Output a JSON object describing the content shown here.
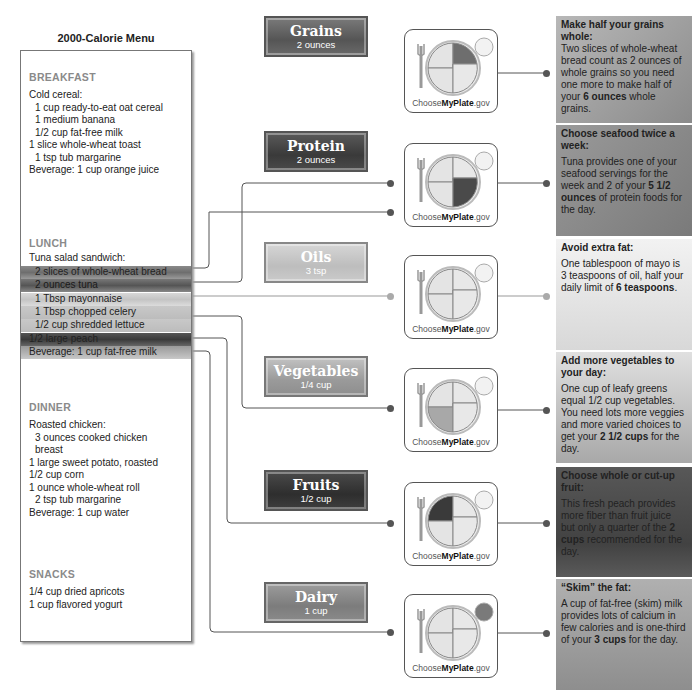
{
  "menu": {
    "title": "2000-Calorie Menu",
    "breakfast": {
      "title": "BREAKFAST",
      "lines": [
        "Cold cereal:",
        "1 cup ready-to-eat oat cereal",
        "1 medium banana",
        "1/2 cup fat-free milk",
        "1 slice whole-wheat toast",
        "1 tsp tub margarine",
        "Beverage: 1 cup orange juice"
      ]
    },
    "lunch": {
      "title": "LUNCH",
      "lines": [
        "Tuna salad sandwich:",
        "2 slices of whole-wheat bread",
        "2 ounces tuna",
        "1 Tbsp mayonnaise",
        "1 Tbsp chopped celery",
        "1/2 cup shredded lettuce",
        "1/2 large peach",
        "Beverage: 1 cup fat-free milk"
      ]
    },
    "dinner": {
      "title": "DINNER",
      "lines": [
        "Roasted chicken:",
        "3 ounces cooked chicken",
        "breast",
        "1 large sweet potato, roasted",
        "1/2 cup corn",
        "1 ounce whole-wheat roll",
        "2 tsp tub margarine",
        "Beverage: 1 cup water"
      ]
    },
    "snacks": {
      "title": "SNACKS",
      "lines": [
        "1/4 cup dried apricots",
        "1 cup flavored  yogurt"
      ]
    }
  },
  "categories": [
    {
      "name": "Grains",
      "amount": "2 ounces",
      "color": "#6a6a6a"
    },
    {
      "name": "Protein",
      "amount": "2 ounces",
      "color": "#4a4a4a"
    },
    {
      "name": "Oils",
      "amount": "3 tsp",
      "color": "#c8c8c8"
    },
    {
      "name": "Vegetables",
      "amount": "1/4 cup",
      "color": "#a8a8a8"
    },
    {
      "name": "Fruits",
      "amount": "1/2 cup",
      "color": "#3c3c3c"
    },
    {
      "name": "Dairy",
      "amount": "1 cup",
      "color": "#8a8a8a"
    }
  ],
  "plate": {
    "brand_prefix": "Choose",
    "brand_bold": "MyPlate",
    "brand_suffix": ".gov"
  },
  "callouts": [
    {
      "head": "Make half your grains whole:",
      "body_pre": "Two slices of whole-wheat bread count as 2 ounces of whole grains so you need one more to make half of your ",
      "body_bold": "6 ounces",
      "body_post": " whole grains."
    },
    {
      "head": "Choose seafood twice a week:",
      "body_pre": "Tuna provides one of your seafood servings for the week and 2 of your ",
      "body_bold": "5 1/2 ounces",
      "body_post": " of protein foods for the day."
    },
    {
      "head": "Avoid extra fat:",
      "body_pre": "One tablespoon of mayo is 3 teaspoons of oil, half your daily limit of ",
      "body_bold": "6 teaspoons",
      "body_post": "."
    },
    {
      "head": "Add more vegetables to your day:",
      "body_pre": "One cup of leafy greens equal 1/2 cup vegetables. You need lots more veggies and more varied choices to get your ",
      "body_bold": "2 1/2 cups",
      "body_post": " for the day."
    },
    {
      "head": "Choose whole or cut-up fruit:",
      "body_pre": "This fresh peach provides more fiber than fruit juice but only a quarter of the ",
      "body_bold": "2 cups",
      "body_post": " recommended for the day."
    },
    {
      "head": "“Skim” the fat:",
      "body_pre": "A cup of fat-free (skim) milk provides lots of calcium in few calories and is one-third of your ",
      "body_bold": "3 cups",
      "body_post": " for the day."
    }
  ]
}
